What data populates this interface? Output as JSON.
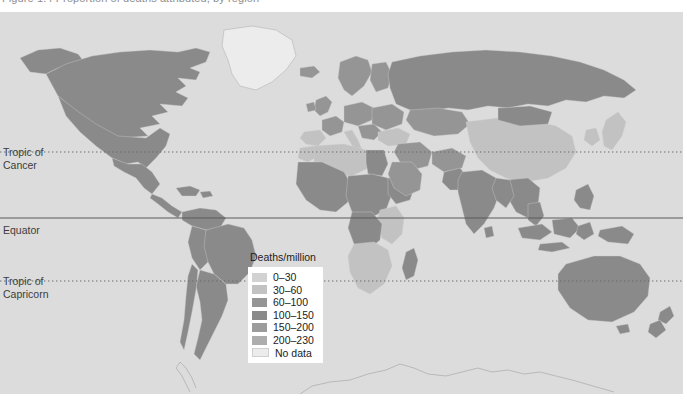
{
  "caption": {
    "text": "Figure 1.4  Proportion of deaths attributed, by region"
  },
  "map": {
    "title": "World map of deaths per million",
    "ocean_color": "#dcdcdc",
    "border_color": "#c8c8c8",
    "latitude_lines": [
      {
        "name": "tropic-of-cancer",
        "label_line1": "Tropic of",
        "label_line2": "Cancer",
        "style": "dotted",
        "y": 152
      },
      {
        "name": "equator",
        "label_line1": "Equator",
        "label_line2": "",
        "style": "solid",
        "y": 218
      },
      {
        "name": "tropic-of-capricorn",
        "label_line1": "Tropic of",
        "label_line2": "Capricorn",
        "style": "dotted",
        "y": 281
      }
    ]
  },
  "legend": {
    "title": "Deaths/million",
    "entries": [
      {
        "label": "0–30",
        "color": "#d2d2d2"
      },
      {
        "label": "30–60",
        "color": "#c2c2c2"
      },
      {
        "label": "60–100",
        "color": "#959595"
      },
      {
        "label": "100–150",
        "color": "#8a8a8a"
      },
      {
        "label": "150–200",
        "color": "#9c9c9c"
      },
      {
        "label": "200–230",
        "color": "#adadad"
      },
      {
        "label": "No data",
        "color": "#ececec"
      }
    ]
  },
  "chart_data": {
    "type": "heatmap",
    "xlabel": "",
    "ylabel": "",
    "legend_position": "center",
    "grid": false,
    "value_unit": "deaths per million",
    "bins": [
      "0–30",
      "30–60",
      "60–100",
      "100–150",
      "150–200",
      "200–230",
      "No data"
    ],
    "bin_colors": [
      "#d2d2d2",
      "#c2c2c2",
      "#959595",
      "#8a8a8a",
      "#9c9c9c",
      "#adadad",
      "#ececec"
    ],
    "regions": [
      {
        "name": "Canada",
        "bin": "100–150"
      },
      {
        "name": "United States",
        "bin": "100–150"
      },
      {
        "name": "Alaska",
        "bin": "100–150"
      },
      {
        "name": "Greenland",
        "bin": "No data"
      },
      {
        "name": "Iceland",
        "bin": "60–100"
      },
      {
        "name": "Mexico",
        "bin": "100–150"
      },
      {
        "name": "Central America",
        "bin": "100–150"
      },
      {
        "name": "Caribbean",
        "bin": "100–150"
      },
      {
        "name": "Brazil",
        "bin": "100–150"
      },
      {
        "name": "Argentina",
        "bin": "100–150"
      },
      {
        "name": "Chile",
        "bin": "100–150"
      },
      {
        "name": "Peru",
        "bin": "100–150"
      },
      {
        "name": "Colombia",
        "bin": "100–150"
      },
      {
        "name": "Venezuela",
        "bin": "100–150"
      },
      {
        "name": "United Kingdom",
        "bin": "60–100"
      },
      {
        "name": "Ireland",
        "bin": "60–100"
      },
      {
        "name": "Scandinavia",
        "bin": "60–100"
      },
      {
        "name": "France",
        "bin": "60–100"
      },
      {
        "name": "Spain",
        "bin": "30–60"
      },
      {
        "name": "Portugal",
        "bin": "30–60"
      },
      {
        "name": "Italy",
        "bin": "30–60"
      },
      {
        "name": "Germany",
        "bin": "60–100"
      },
      {
        "name": "Poland",
        "bin": "60–100"
      },
      {
        "name": "Eastern Europe",
        "bin": "60–100"
      },
      {
        "name": "Turkey",
        "bin": "30–60"
      },
      {
        "name": "Russia",
        "bin": "100–150"
      },
      {
        "name": "Kazakhstan",
        "bin": "60–100"
      },
      {
        "name": "Middle East",
        "bin": "30–60"
      },
      {
        "name": "Saudi Arabia",
        "bin": "60–100"
      },
      {
        "name": "Iran",
        "bin": "60–100"
      },
      {
        "name": "Afghanistan",
        "bin": "60–100"
      },
      {
        "name": "India",
        "bin": "100–150"
      },
      {
        "name": "Pakistan",
        "bin": "100–150"
      },
      {
        "name": "China",
        "bin": "30–60"
      },
      {
        "name": "Mongolia",
        "bin": "100–150"
      },
      {
        "name": "Japan",
        "bin": "30–60"
      },
      {
        "name": "Korea",
        "bin": "30–60"
      },
      {
        "name": "Southeast Asia",
        "bin": "100–150"
      },
      {
        "name": "Indonesia",
        "bin": "100–150"
      },
      {
        "name": "Philippines",
        "bin": "100–150"
      },
      {
        "name": "Australia",
        "bin": "100–150"
      },
      {
        "name": "New Zealand",
        "bin": "100–150"
      },
      {
        "name": "Papua New Guinea",
        "bin": "100–150"
      },
      {
        "name": "North Africa",
        "bin": "30–60"
      },
      {
        "name": "Egypt",
        "bin": "100–150"
      },
      {
        "name": "Libya",
        "bin": "30–60"
      },
      {
        "name": "Algeria",
        "bin": "30–60"
      },
      {
        "name": "Morocco",
        "bin": "30–60"
      },
      {
        "name": "Sahel",
        "bin": "100–150"
      },
      {
        "name": "West Africa",
        "bin": "100–150"
      },
      {
        "name": "Central Africa",
        "bin": "100–150"
      },
      {
        "name": "Horn of Africa",
        "bin": "100–150"
      },
      {
        "name": "East Africa",
        "bin": "30–60"
      },
      {
        "name": "Angola",
        "bin": "100–150"
      },
      {
        "name": "South Africa",
        "bin": "30–60"
      },
      {
        "name": "Madagascar",
        "bin": "100–150"
      },
      {
        "name": "Antarctica",
        "bin": "No data"
      }
    ]
  }
}
